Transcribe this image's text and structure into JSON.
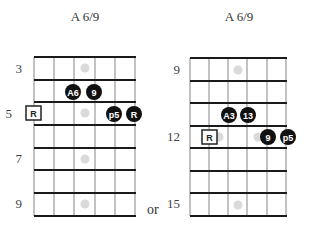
{
  "diagrams": [
    {
      "title": "A 6/9",
      "fret_labels": [
        {
          "text": "3",
          "row": 0
        },
        {
          "text": "5",
          "row": 2
        },
        {
          "text": "7",
          "row": 4
        },
        {
          "text": "9",
          "row": 6
        }
      ],
      "start_fret": 3,
      "rows": 7,
      "strings": 6,
      "inlay_markers": [
        {
          "row": 0
        },
        {
          "row": 2
        },
        {
          "row": 4
        },
        {
          "row": 6
        }
      ],
      "notes": [
        {
          "label": "A6",
          "string": 3,
          "row": 1,
          "style": "filled"
        },
        {
          "label": "9",
          "string": 4,
          "row": 1,
          "style": "filled"
        },
        {
          "label": "R",
          "string": 1,
          "row": 2,
          "style": "square"
        },
        {
          "label": "p5",
          "string": 5,
          "row": 2,
          "style": "filled"
        },
        {
          "label": "R",
          "string": 6,
          "row": 2,
          "style": "filled"
        }
      ]
    },
    {
      "title": "A 6/9",
      "fret_labels": [
        {
          "text": "9",
          "row": 0
        },
        {
          "text": "12",
          "row": 3
        },
        {
          "text": "15",
          "row": 6
        }
      ],
      "start_fret": 9,
      "rows": 7,
      "strings": 6,
      "inlay_markers": [
        {
          "row": 0
        },
        {
          "row": 3,
          "double": true
        },
        {
          "row": 6
        }
      ],
      "notes": [
        {
          "label": "A3",
          "string": 3,
          "row": 2,
          "style": "filled"
        },
        {
          "label": "13",
          "string": 4,
          "row": 2,
          "style": "filled"
        },
        {
          "label": "R",
          "string": 2,
          "row": 3,
          "style": "square"
        },
        {
          "label": "9",
          "string": 5,
          "row": 3,
          "style": "filled"
        },
        {
          "label": "p5",
          "string": 6,
          "row": 3,
          "style": "filled"
        }
      ]
    }
  ],
  "separator_text": "or",
  "colors": {
    "grid_line": "#1a1a1a",
    "string_line": "#999999",
    "note_fill": "#111111",
    "note_text": "#ffffff",
    "inlay": "#d9d9d9"
  }
}
